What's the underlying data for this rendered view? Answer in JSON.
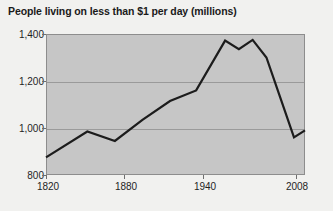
{
  "chart_data": {
    "type": "line",
    "title": "People living on less than $1 per day (millions)",
    "xlabel": "",
    "ylabel": "",
    "xlim": [
      1820,
      2008
    ],
    "ylim": [
      800,
      1400
    ],
    "grid": true,
    "legend": "none",
    "xticks": [
      1820,
      1880,
      1940,
      2008
    ],
    "xtick_labels": [
      "1820",
      "1880",
      "1940",
      "2008"
    ],
    "yticks": [
      800,
      1000,
      1200,
      1400
    ],
    "ytick_labels": [
      "800",
      "1,000",
      "1,200",
      "1,400"
    ],
    "series": [
      {
        "name": "People living on less than $1 per day (millions)",
        "x": [
          1820,
          1850,
          1870,
          1890,
          1910,
          1929,
          1950,
          1960,
          1970,
          1980,
          1990,
          2000,
          2008
        ],
        "values": [
          875,
          985,
          945,
          1035,
          1115,
          1160,
          1372,
          1335,
          1375,
          1300,
          1130,
          960,
          990
        ],
        "color": "#1c1c1c"
      }
    ]
  },
  "axes": {
    "plot_background": "#c6c6c6",
    "grid_color": "#9a9a9a",
    "border_color": "#8d8d8d"
  },
  "figure": {
    "background": "#f1f1ef"
  }
}
